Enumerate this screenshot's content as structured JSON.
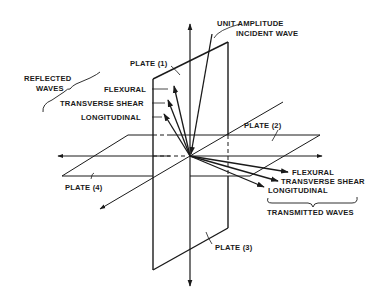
{
  "diagram": {
    "incident": {
      "line1": "UNIT AMPLITUDE",
      "line2": "INCIDENT WAVE"
    },
    "plates": {
      "plate1": "PLATE (1)",
      "plate2": "PLATE (2)",
      "plate3": "PLATE (3)",
      "plate4": "PLATE (4)"
    },
    "reflected": {
      "group": {
        "line1": "REFLECTED",
        "line2": "WAVES"
      },
      "flexural": "FLEXURAL",
      "transverse_shear": "TRANSVERSE SHEAR",
      "longitudinal": "LONGITUDINAL"
    },
    "transmitted": {
      "group": "TRANSMITTED WAVES",
      "flexural": "FLEXURAL",
      "transverse_shear": "TRANSVERSE SHEAR",
      "longitudinal": "LONGITUDINAL"
    },
    "colors": {
      "ink": "#1a1a1a",
      "background": "#ffffff"
    }
  }
}
